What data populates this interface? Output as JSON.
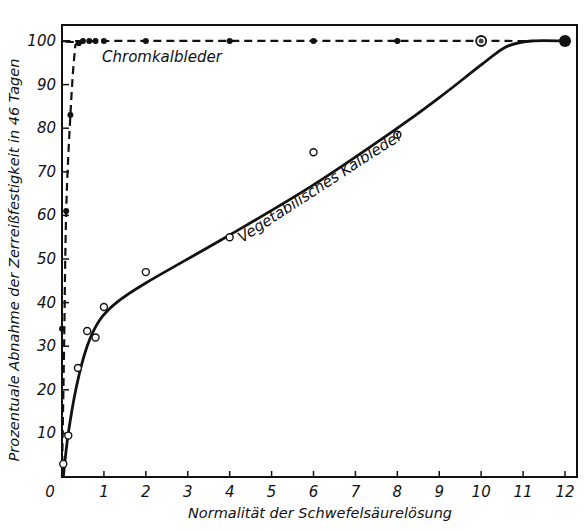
{
  "chart_data": {
    "type": "line",
    "title": "",
    "xlabel": "Normalität der Schwefelsäurelösung",
    "ylabel": "Prozentuale Abnahme der Zerreißfestigkeit in 46 Tagen",
    "xlim": [
      0,
      12
    ],
    "ylim": [
      0,
      104
    ],
    "xticks": [
      "0",
      "1",
      "2",
      "3",
      "4",
      "5",
      "6",
      "7",
      "8",
      "9",
      "10",
      "11",
      "12"
    ],
    "yticks": [
      "10",
      "20",
      "30",
      "40",
      "50",
      "60",
      "70",
      "80",
      "90",
      "100"
    ],
    "grid": false,
    "legend": "none (inline curve labels)",
    "series": [
      {
        "name": "Chromkalbleder",
        "line_style": "dashed",
        "marker": "filled-circle",
        "color": "#111111",
        "points": [
          {
            "x": 0.0,
            "y": 34
          },
          {
            "x": 0.1,
            "y": 61
          },
          {
            "x": 0.2,
            "y": 83
          },
          {
            "x": 0.4,
            "y": 99.5
          },
          {
            "x": 0.5,
            "y": 100
          },
          {
            "x": 0.65,
            "y": 100
          },
          {
            "x": 0.8,
            "y": 100
          },
          {
            "x": 1.0,
            "y": 100
          },
          {
            "x": 2.0,
            "y": 100
          },
          {
            "x": 4.0,
            "y": 100
          },
          {
            "x": 6.0,
            "y": 100
          },
          {
            "x": 8.0,
            "y": 100
          },
          {
            "x": 10.0,
            "y": 100
          },
          {
            "x": 12.0,
            "y": 100
          }
        ],
        "curve": [
          {
            "x": 0.0,
            "y": 0
          },
          {
            "x": 0.05,
            "y": 30
          },
          {
            "x": 0.1,
            "y": 61
          },
          {
            "x": 0.2,
            "y": 83
          },
          {
            "x": 0.3,
            "y": 97
          },
          {
            "x": 0.4,
            "y": 99.5
          },
          {
            "x": 1.0,
            "y": 100
          },
          {
            "x": 12.0,
            "y": 100
          }
        ],
        "label": "Chromkalbleder"
      },
      {
        "name": "Vegetabilisches Kalbleder",
        "line_style": "solid",
        "marker": "open-circle",
        "color": "#111111",
        "points": [
          {
            "x": 0.03,
            "y": 3
          },
          {
            "x": 0.15,
            "y": 9.5
          },
          {
            "x": 0.38,
            "y": 25
          },
          {
            "x": 0.6,
            "y": 33.5
          },
          {
            "x": 0.8,
            "y": 32
          },
          {
            "x": 1.0,
            "y": 39
          },
          {
            "x": 2.0,
            "y": 47
          },
          {
            "x": 4.0,
            "y": 55
          },
          {
            "x": 6.0,
            "y": 74.5
          },
          {
            "x": 8.0,
            "y": 78.5
          }
        ],
        "curve": [
          {
            "x": 0.03,
            "y": 0
          },
          {
            "x": 0.15,
            "y": 10
          },
          {
            "x": 0.35,
            "y": 21
          },
          {
            "x": 0.6,
            "y": 30
          },
          {
            "x": 0.9,
            "y": 36
          },
          {
            "x": 1.3,
            "y": 40
          },
          {
            "x": 2.0,
            "y": 44.5
          },
          {
            "x": 4.0,
            "y": 55.5
          },
          {
            "x": 6.0,
            "y": 67
          },
          {
            "x": 8.0,
            "y": 80
          },
          {
            "x": 9.0,
            "y": 87
          },
          {
            "x": 10.0,
            "y": 94.5
          },
          {
            "x": 10.6,
            "y": 98.7
          },
          {
            "x": 11.2,
            "y": 100
          },
          {
            "x": 12.0,
            "y": 100
          }
        ],
        "label": "Vegetabilisches Kalbleder"
      }
    ],
    "special_markers": [
      {
        "series": "Chromkalbleder",
        "x": 10,
        "y": 100,
        "style": "double-circle"
      },
      {
        "series": "Chromkalbleder",
        "x": 12,
        "y": 100,
        "style": "large-filled-circle"
      }
    ],
    "origin_label": "0"
  }
}
